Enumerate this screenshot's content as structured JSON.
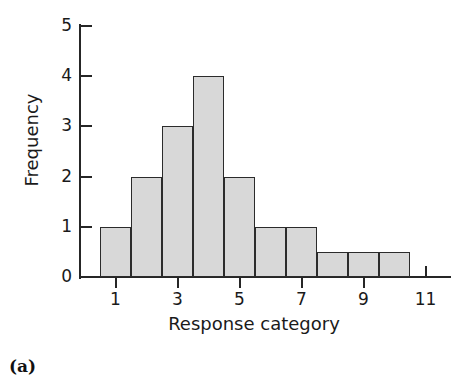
{
  "figure": {
    "caption": "(a)",
    "background_color": "#ffffff"
  },
  "chart_data": {
    "type": "bar",
    "title": "",
    "subtitle": "",
    "xlabel": "Response category",
    "ylabel": "Frequency",
    "categories": [
      1,
      2,
      3,
      4,
      5,
      6,
      7,
      8,
      9,
      10
    ],
    "values": [
      1,
      2,
      3,
      4,
      2,
      1,
      1,
      0.5,
      0.5,
      0.5
    ],
    "xlim": [
      0.5,
      11.5
    ],
    "ylim": [
      0,
      5
    ],
    "x_ticks": [
      1,
      3,
      5,
      7,
      9,
      11
    ],
    "x_tick_labels": [
      "1",
      "3",
      "5",
      "7",
      "9",
      "11"
    ],
    "y_ticks": [
      0,
      1,
      2,
      3,
      4,
      5
    ],
    "y_tick_labels": [
      "0",
      "1",
      "2",
      "3",
      "4",
      "5"
    ],
    "grid": false,
    "legend": null,
    "legend_position": "none",
    "bar_fill_color": "#d8d8d8",
    "bar_edge_color": "#2b2b2b",
    "axis_color": "#262626",
    "bar_width": 1,
    "annotations": []
  }
}
